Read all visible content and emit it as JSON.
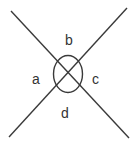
{
  "diagram": {
    "title": "",
    "labels": {
      "a": "a",
      "b": "b",
      "c": "c",
      "d": "d"
    },
    "colors": {
      "line": "#3a3a3a",
      "text": "#333333",
      "background": "#ffffff"
    }
  }
}
